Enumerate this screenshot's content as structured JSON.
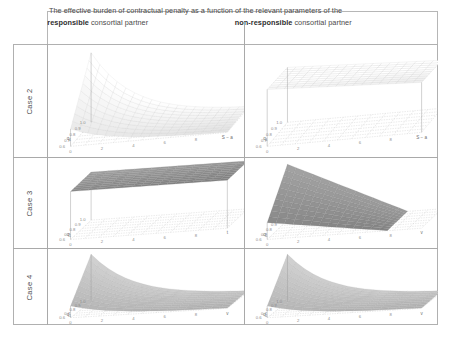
{
  "figure": {
    "caption_header": {
      "line1": "The effective burden of contractual penalty as a function of the relevant parameters of the",
      "left_strong": "responsible",
      "left_rest": " consortial partner",
      "right_strong": "non-responsible",
      "right_rest": " consortial partner"
    },
    "row_labels": [
      "Case 2",
      "Case 3",
      "Case 4"
    ],
    "colors": {
      "frame": "#b0b0b0",
      "grid": "#a9a9a9",
      "text": "#4a4a4a",
      "surface_light": "#f2f2f2",
      "surface_mid": "#b8b8b8",
      "surface_dark": "#8a8a8a",
      "mesh": "#9a9a9a"
    }
  },
  "chart_data": [
    {
      "id": "case2-responsible",
      "type": "surface",
      "title": "Case 2 — responsible consortial partner",
      "xlabel": "S − a",
      "ylabel": "q₁",
      "zlabel": "",
      "shape": "convex-decaying-ridge",
      "description": "High ridge along the back-left edge decaying sharply toward the front-right; light mesh surface.",
      "x_ticks": [
        "0",
        "2",
        "4",
        "6",
        "8",
        "S − a"
      ],
      "y_ticks": [
        "1.0",
        "0.9",
        "0.8",
        "0.7",
        "0.6"
      ],
      "z_range": [
        0,
        1
      ],
      "grid": true,
      "surface_tone": "light"
    },
    {
      "id": "case2-non-responsible",
      "type": "surface",
      "title": "Case 2 — non-responsible consortial partner",
      "xlabel": "S − a",
      "ylabel": "q₁",
      "zlabel": "",
      "shape": "flat-thin-sheet",
      "description": "Near-flat thin elevated sheet with slight tilt downward to the right.",
      "x_ticks": [
        "0",
        "2",
        "4",
        "6",
        "8",
        "S − a"
      ],
      "y_ticks": [
        "1.0",
        "0.9",
        "0.8",
        "0.7",
        "0.6"
      ],
      "z_range": [
        0,
        1
      ],
      "grid": true,
      "surface_tone": "white"
    },
    {
      "id": "case3-responsible",
      "type": "surface",
      "title": "Case 3 — responsible consortial partner",
      "xlabel": "t",
      "ylabel": "q₁",
      "zlabel": "",
      "shape": "flat-elevated-plane",
      "description": "Uniform dark-gray flat plane elevated at constant height across the domain.",
      "x_ticks": [
        "0",
        "2",
        "4",
        "6",
        "8",
        "t"
      ],
      "y_ticks": [
        "1.0",
        "0.9",
        "0.8",
        "0.7",
        "0.6"
      ],
      "z_range": [
        0,
        1
      ],
      "grid": true,
      "surface_tone": "dark"
    },
    {
      "id": "case3-non-responsible",
      "type": "surface",
      "title": "Case 3 — non-responsible consortial partner",
      "xlabel": "v",
      "ylabel": "q₁",
      "zlabel": "",
      "shape": "descending-ramp",
      "description": "Dark gray surface high at the left edge falling linearly to zero toward the right.",
      "x_ticks": [
        "0",
        "2",
        "4",
        "6",
        "8",
        "v"
      ],
      "y_ticks": [
        "1.0",
        "0.9",
        "0.8",
        "0.7",
        "0.6"
      ],
      "z_range": [
        0,
        1
      ],
      "grid": true,
      "surface_tone": "dark"
    },
    {
      "id": "case4-responsible",
      "type": "surface",
      "title": "Case 4 — responsible consortial partner",
      "xlabel": "v",
      "ylabel": "q₁",
      "zlabel": "",
      "shape": "convex-decaying-ridge",
      "description": "Mid-gray curved surface, high back ridge decaying steeply toward the front-right.",
      "x_ticks": [
        "0",
        "2",
        "4",
        "6",
        "8",
        "v"
      ],
      "y_ticks": [
        "1.0",
        "0.9",
        "0.8",
        "0.7",
        "0.6"
      ],
      "z_range": [
        0,
        1
      ],
      "grid": true,
      "surface_tone": "mid"
    },
    {
      "id": "case4-non-responsible",
      "type": "surface",
      "title": "Case 4 — non-responsible consortial partner",
      "xlabel": "v",
      "ylabel": "q₁",
      "zlabel": "",
      "shape": "convex-decaying-ridge",
      "description": "Mid-gray curved surface decaying from a high left ridge toward the right, flattening out.",
      "x_ticks": [
        "0",
        "2",
        "4",
        "6",
        "8",
        "v"
      ],
      "y_ticks": [
        "1.0",
        "0.9",
        "0.8",
        "0.7",
        "0.6"
      ],
      "z_range": [
        0,
        1
      ],
      "grid": true,
      "surface_tone": "mid"
    }
  ]
}
